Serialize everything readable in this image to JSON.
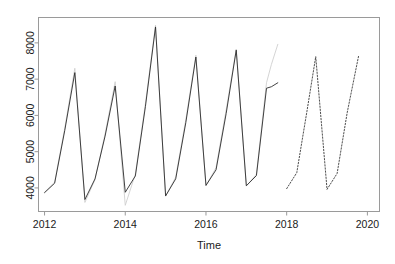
{
  "chart_data": {
    "type": "line",
    "title": "",
    "subtitle": "",
    "xlabel": "Time",
    "ylabel": "",
    "xlim": [
      2011.85,
      2020.3
    ],
    "ylim": [
      3350,
      8700
    ],
    "grid": false,
    "legend": null,
    "x_ticks": [
      2012,
      2014,
      2016,
      2018,
      2020
    ],
    "x_tick_labels": [
      "2012",
      "2014",
      "2016",
      "2018",
      "2020"
    ],
    "y_ticks": [
      4000,
      5000,
      6000,
      7000,
      8000
    ],
    "y_tick_labels": [
      "4000",
      "5000",
      "6000",
      "7000",
      "8000"
    ],
    "series": [
      {
        "name": "observed",
        "style": "solid",
        "color": "#2b2b2b",
        "x": [
          2012.0,
          2012.25,
          2012.5,
          2012.75,
          2013.0,
          2013.25,
          2013.5,
          2013.75,
          2014.0,
          2014.25,
          2014.5,
          2014.75,
          2015.0,
          2015.25,
          2015.5,
          2015.75,
          2016.0,
          2016.25,
          2016.5,
          2016.75,
          2017.0,
          2017.25,
          2017.5,
          2017.62,
          2017.78
        ],
        "y": [
          3870,
          4130,
          5580,
          7180,
          3680,
          4250,
          5430,
          6810,
          3880,
          4330,
          6250,
          8440,
          3780,
          4250,
          5800,
          7610,
          4070,
          4500,
          6050,
          7800,
          4060,
          4340,
          6750,
          6790,
          6900
        ]
      },
      {
        "name": "forecast",
        "style": "dotted",
        "color": "#3a3a3a",
        "x": [
          2018.0,
          2018.25,
          2018.5,
          2018.72,
          2019.0,
          2019.25,
          2019.5,
          2019.78
        ],
        "y": [
          3980,
          4420,
          6100,
          7620,
          3960,
          4400,
          6080,
          7630
        ]
      },
      {
        "name": "interval-upper-ghost",
        "style": "solid-light",
        "color": "#cfcfcf",
        "x": [
          2012.0,
          2012.25,
          2012.5,
          2012.75,
          2013.0,
          2013.25,
          2013.5,
          2013.75,
          2014.0,
          2014.25,
          2014.5,
          2014.75,
          2015.0,
          2015.25,
          2015.5,
          2015.75,
          2016.0,
          2016.25,
          2016.5,
          2016.75,
          2017.0,
          2017.25,
          2017.5,
          2017.62,
          2017.78
        ],
        "y": [
          3880,
          4160,
          5640,
          7300,
          3600,
          4230,
          5490,
          6930,
          3520,
          4380,
          6330,
          8490,
          3770,
          4300,
          5880,
          7660,
          4060,
          4560,
          6150,
          7830,
          4050,
          4380,
          6900,
          7400,
          7960
        ]
      }
    ],
    "annotations": []
  },
  "axes": {
    "x_title": "Time"
  }
}
